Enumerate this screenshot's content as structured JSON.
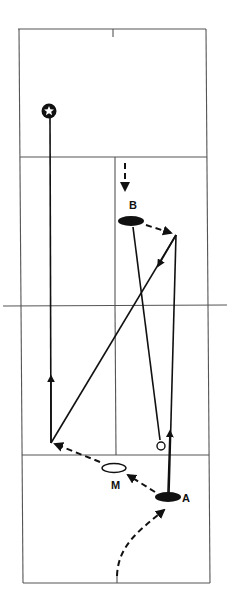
{
  "diagram": {
    "type": "badminton-court-drill",
    "colors": {
      "ink": "#111111",
      "court_line": "#555555",
      "background": "#ffffff"
    },
    "players": [
      {
        "id": "B",
        "label": "B",
        "fill": "filled"
      },
      {
        "id": "A",
        "label": "A",
        "fill": "filled"
      },
      {
        "id": "M",
        "label": "M",
        "fill": "hollow"
      }
    ],
    "markers": [
      {
        "name": "target-star-icon",
        "kind": "star-in-circle"
      },
      {
        "name": "shuttle-icon",
        "kind": "open-circle"
      }
    ],
    "paths": [
      {
        "name": "approach-to-b",
        "style": "dashed-arrow"
      },
      {
        "name": "b-to-right",
        "style": "dashed-arrow"
      },
      {
        "name": "right-diagonal-to-left",
        "style": "solid-arrow"
      },
      {
        "name": "left-up-to-star",
        "style": "solid-arrow"
      },
      {
        "name": "b-to-shuttle",
        "style": "solid"
      },
      {
        "name": "a-up-to-right",
        "style": "solid-arrow"
      },
      {
        "name": "a-to-m-to-left",
        "style": "dashed-arrow"
      },
      {
        "name": "curve-to-a",
        "style": "dashed-arrow"
      }
    ]
  }
}
